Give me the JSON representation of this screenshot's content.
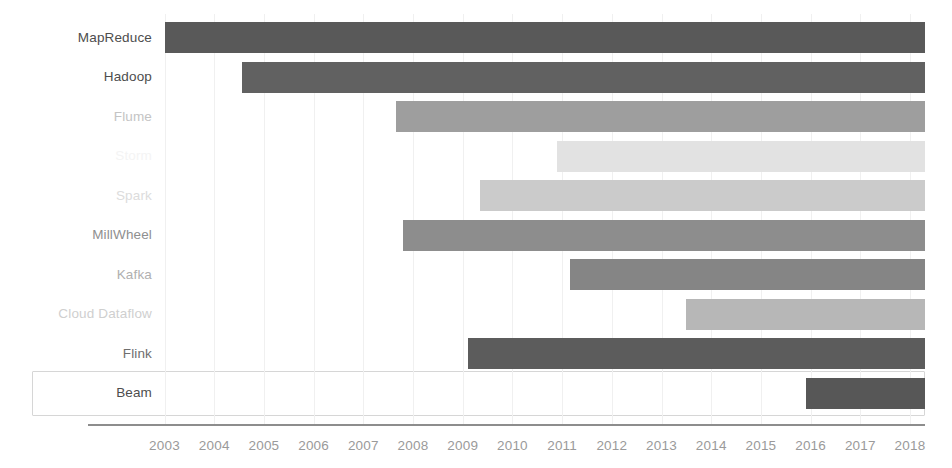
{
  "chart_data": {
    "type": "bar",
    "title": "",
    "subtitle": "",
    "xlabel": "",
    "ylabel": "",
    "orientation": "horizontal",
    "chart_style": "gantt-timeline",
    "grid": true,
    "legend": "none",
    "xlim": [
      2002.5,
      2018.4
    ],
    "x_tick_labels": [
      "2003",
      "2004",
      "2005",
      "2006",
      "2007",
      "2008",
      "2009",
      "2010",
      "2011",
      "2012",
      "2013",
      "2014",
      "2015",
      "2016",
      "2017",
      "2018"
    ],
    "x_ticks": [
      2003,
      2004,
      2005,
      2006,
      2007,
      2008,
      2009,
      2010,
      2011,
      2012,
      2013,
      2014,
      2015,
      2016,
      2017,
      2018
    ],
    "categories": [
      "MapReduce",
      "Hadoop",
      "Flume",
      "Storm",
      "Spark",
      "MillWheel",
      "Kafka",
      "Cloud Dataflow",
      "Flink",
      "Beam"
    ],
    "bars": [
      {
        "label": "MapReduce",
        "start": 2003.0,
        "end": 2018.3,
        "color": "#595959",
        "label_color": "#4d4d4d",
        "highlighted": false
      },
      {
        "label": "Hadoop",
        "start": 2004.55,
        "end": 2018.3,
        "color": "#616161",
        "label_color": "#4d4d4d",
        "highlighted": false
      },
      {
        "label": "Flume",
        "start": 2007.65,
        "end": 2018.3,
        "color": "#9e9e9e",
        "label_color": "#c4c4c4",
        "highlighted": false
      },
      {
        "label": "Storm",
        "start": 2010.9,
        "end": 2018.3,
        "color": "#e2e2e2",
        "label_color": "#f4f4f4",
        "highlighted": false
      },
      {
        "label": "Spark",
        "start": 2009.35,
        "end": 2018.3,
        "color": "#cbcbcb",
        "label_color": "#dcdcdc",
        "highlighted": false
      },
      {
        "label": "MillWheel",
        "start": 2007.8,
        "end": 2018.3,
        "color": "#8d8d8d",
        "label_color": "#8f8f8f",
        "highlighted": false
      },
      {
        "label": "Kafka",
        "start": 2011.15,
        "end": 2018.3,
        "color": "#858585",
        "label_color": "#b0b0b0",
        "highlighted": false
      },
      {
        "label": "Cloud Dataflow",
        "start": 2013.5,
        "end": 2018.3,
        "color": "#b7b7b7",
        "label_color": "#cfcfcf",
        "highlighted": false
      },
      {
        "label": "Flink",
        "start": 2009.1,
        "end": 2018.3,
        "color": "#5c5c5c",
        "label_color": "#6e6e6e",
        "highlighted": false
      },
      {
        "label": "Beam",
        "start": 2015.9,
        "end": 2018.3,
        "color": "#575757",
        "label_color": "#4d4d4d",
        "highlighted": true
      }
    ]
  },
  "colors": {
    "background": "#ffffff",
    "axis": "#8d8d8d",
    "gridline": "#f0f0f0",
    "highlight_border": "#d6d6d6",
    "tick_text": "#9a9a9a"
  }
}
